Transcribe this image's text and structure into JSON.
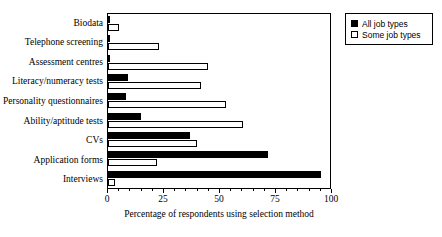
{
  "chart_data": {
    "type": "bar",
    "orientation": "horizontal",
    "title": "",
    "xlabel": "Percentage of respondents using selection method",
    "ylabel": "",
    "xlim": [
      0,
      100
    ],
    "xticks": [
      0,
      25,
      50,
      75,
      100
    ],
    "xtick_labels": [
      "0",
      "25",
      "50",
      "75",
      "100"
    ],
    "minor_ticks": [
      5,
      10,
      15,
      20,
      30,
      35,
      40,
      45,
      55,
      60,
      65,
      70,
      80,
      85,
      90,
      95
    ],
    "grid": false,
    "legend_position": "upper right outside",
    "categories": [
      "Biodata",
      "Telephone screening",
      "Assessment centres",
      "Literacy/numeracy tests",
      "Personality questionnaires",
      "Ability/aptitude tests",
      "CVs",
      "Application forms",
      "Interviews"
    ],
    "series": [
      {
        "name": "All job types",
        "color": "#000000",
        "fill": "solid",
        "values": [
          1,
          1,
          0,
          9,
          8,
          15,
          37,
          72,
          96
        ]
      },
      {
        "name": "Some job types",
        "color": "#ffffff",
        "fill": "hollow",
        "values": [
          5,
          23,
          45,
          42,
          53,
          61,
          40,
          22,
          3
        ]
      }
    ]
  },
  "legend": {
    "items": [
      {
        "label": "All job types",
        "swatch": "filled-square-icon"
      },
      {
        "label": "Some job types",
        "swatch": "hollow-square-icon"
      }
    ]
  },
  "axis": {
    "x_title": "Percentage of respondents using selection method"
  }
}
